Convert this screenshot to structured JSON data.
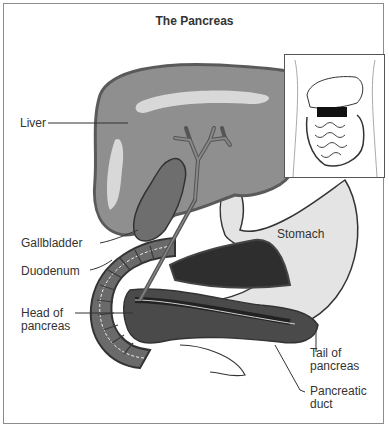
{
  "title": "The Pancreas",
  "labels": {
    "liver": "Liver",
    "gallbladder": "Gallbladder",
    "duodenum": "Duodenum",
    "head_line1": "Head of",
    "head_line2": "pancreas",
    "stomach": "Stomach",
    "tail_line1": "Tail of",
    "tail_line2": "pancreas",
    "duct_line1": "Pancreatic",
    "duct_line2": "duct"
  },
  "colors": {
    "liver": "#8f8f8f",
    "liver_edge": "#5a5a5a",
    "liver_highlight": "#d8d8d8",
    "gallbladder": "#6e6e6e",
    "stomach": "#e4e4e4",
    "pancreas": "#4a4a4a",
    "pancreas_dark": "#222222",
    "duodenum": "#6a6a6a",
    "outline": "#333333",
    "text": "#333333"
  },
  "inset": {
    "description": "torso-location-inset",
    "highlight": "pancreas"
  }
}
